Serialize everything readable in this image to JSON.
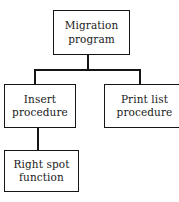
{
  "diagram": {
    "type": "hierarchy-tree",
    "background_color": "#ffffff",
    "line_color": "#151515",
    "text_color": "#1a1a1a",
    "nodes": [
      {
        "id": "migration-program",
        "label": "Migration\nprogram",
        "level": 0
      },
      {
        "id": "insert-procedure",
        "label": "Insert\nprocedure",
        "level": 1
      },
      {
        "id": "print-list-procedure",
        "label": "Print list\nprocedure",
        "level": 1
      },
      {
        "id": "right-spot-function",
        "label": "Right spot\nfunction",
        "level": 2
      }
    ],
    "edges": [
      {
        "from": "migration-program",
        "to": "insert-procedure"
      },
      {
        "from": "migration-program",
        "to": "print-list-procedure"
      },
      {
        "from": "insert-procedure",
        "to": "right-spot-function"
      }
    ]
  }
}
